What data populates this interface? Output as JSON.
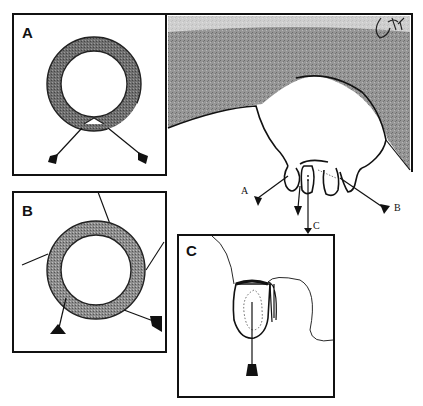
{
  "figure": {
    "colors": {
      "line": "#111111",
      "udder_shade": "#7a7a7a",
      "ring_fill": "#6e6e6e",
      "background": "#ffffff"
    },
    "panels": [
      {
        "id": "A",
        "label": "A",
        "content": "ring with notch at bottom and two tagged leads"
      },
      {
        "id": "B",
        "label": "B",
        "content": "shaded ring with four radiating lines, two tagged leads"
      },
      {
        "id": "C",
        "label": "C",
        "content": "teat cross-section with dotted outline and one tagged lead"
      }
    ],
    "main_view": {
      "signature": "JCH",
      "callouts": [
        {
          "label": "A"
        },
        {
          "label": "B"
        },
        {
          "label": "C"
        }
      ]
    }
  }
}
